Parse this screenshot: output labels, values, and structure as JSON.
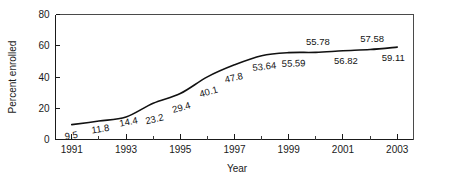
{
  "chart_data": {
    "type": "line",
    "title": "",
    "xlabel": "Year",
    "ylabel": "Percent enrolled",
    "xlim": [
      1990.4,
      2003.6
    ],
    "ylim": [
      0,
      80
    ],
    "grid": false,
    "legend": "none",
    "x": [
      1991,
      1992,
      1993,
      1994,
      1995,
      1996,
      1997,
      1998,
      1999,
      2000,
      2001,
      2002,
      2003
    ],
    "values": [
      9.5,
      11.8,
      14.4,
      23.2,
      29.4,
      40.1,
      47.8,
      53.64,
      55.59,
      55.78,
      56.82,
      57.58,
      59.11
    ],
    "point_labels": [
      "9.5",
      "11.8",
      "14.4",
      "23.2",
      "29.4",
      "40.1",
      "47.8",
      "53.64",
      "55.59",
      "55.78",
      "56.82",
      "57.58",
      "59.11"
    ],
    "xticks": [
      1991,
      1992,
      1993,
      1994,
      1995,
      1996,
      1997,
      1998,
      1999,
      2000,
      2001,
      2002,
      2003
    ],
    "xticklabels": [
      "1991",
      "",
      "1993",
      "",
      "1995",
      "",
      "1997",
      "",
      "1999",
      "",
      "2001",
      "",
      "2003"
    ],
    "yticks": [
      0,
      20,
      40,
      60,
      80
    ],
    "yticklabels": [
      "0",
      "20",
      "40",
      "60",
      "80"
    ],
    "line_color": "#111111",
    "axis_color": "#1a1a1a",
    "frame_color": "#4a4a4a",
    "background_color": "#ffffff",
    "label_offsets": [
      {
        "dx": 0,
        "dy": 14,
        "rot": -9
      },
      {
        "dx": 2,
        "dy": 11,
        "rot": -9
      },
      {
        "dx": 3,
        "dy": 8,
        "rot": -11
      },
      {
        "dx": 2,
        "dy": 19,
        "rot": -13
      },
      {
        "dx": 2,
        "dy": 17,
        "rot": -16
      },
      {
        "dx": 2,
        "dy": 18,
        "rot": -16
      },
      {
        "dx": 0,
        "dy": 16,
        "rot": -13
      },
      {
        "dx": 3,
        "dy": 14,
        "rot": -6
      },
      {
        "dx": 5,
        "dy": 14,
        "rot": -2
      },
      {
        "dx": 2,
        "dy": -7,
        "rot": 0
      },
      {
        "dx": 3,
        "dy": 13,
        "rot": 0
      },
      {
        "dx": 2,
        "dy": -8,
        "rot": 0
      },
      {
        "dx": -4,
        "dy": 14,
        "rot": 0
      }
    ]
  }
}
